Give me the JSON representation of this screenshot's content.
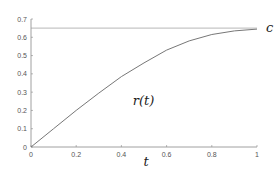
{
  "chart_data": {
    "type": "line",
    "title": "",
    "xlabel": "t",
    "ylabel": "",
    "xlim": [
      0,
      1
    ],
    "ylim": [
      0,
      0.7
    ],
    "grid": false,
    "x_ticks": [
      "0",
      "0.2",
      "0.4",
      "0.6",
      "0.8",
      "1"
    ],
    "y_ticks": [
      "0",
      "0.1",
      "0.2",
      "0.3",
      "0.4",
      "0.5",
      "0.6",
      "0.7"
    ],
    "series": [
      {
        "name": "r(t)",
        "x": [
          0,
          0.1,
          0.2,
          0.3,
          0.4,
          0.5,
          0.6,
          0.7,
          0.8,
          0.9,
          1.0
        ],
        "values": [
          0,
          0.1,
          0.2,
          0.295,
          0.385,
          0.46,
          0.53,
          0.58,
          0.615,
          0.635,
          0.645
        ]
      },
      {
        "name": "c",
        "x": [
          0,
          1
        ],
        "values": [
          0.65,
          0.65
        ]
      }
    ],
    "annotations": [
      {
        "text": "r(t)",
        "x": 0.45,
        "y": 0.23
      },
      {
        "text": "c",
        "x": 1.04,
        "y": 0.65
      }
    ]
  }
}
